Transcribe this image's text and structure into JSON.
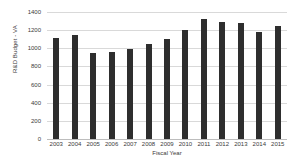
{
  "chart_data": {
    "type": "bar",
    "title": "",
    "xlabel": "Fiscal Year",
    "ylabel": "R&D Budget - VA",
    "categories": [
      "2003",
      "2004",
      "2005",
      "2006",
      "2007",
      "2008",
      "2009",
      "2010",
      "2011",
      "2012",
      "2013",
      "2014",
      "2015"
    ],
    "values": [
      1110,
      1150,
      950,
      955,
      990,
      1050,
      1105,
      1200,
      1325,
      1295,
      1275,
      1180,
      1250
    ],
    "ylim": [
      0,
      1400
    ],
    "yticks": [
      0,
      200,
      400,
      600,
      800,
      1000,
      1200,
      1400
    ],
    "ytick_labels": [
      "0",
      "200",
      "400",
      "600",
      "800",
      "1000",
      "1200",
      "1400"
    ],
    "grid": true,
    "legend": false,
    "series": [
      {
        "name": "R&D Budget - VA",
        "color": "#2e2e2e",
        "values": [
          1110,
          1150,
          950,
          955,
          990,
          1050,
          1105,
          1200,
          1325,
          1295,
          1275,
          1180,
          1250
        ]
      }
    ],
    "colors": {
      "bar": "#2e2e2e",
      "grid": "#d9d9d9",
      "axis": "#bdbdbd",
      "text": "#3a3a3a",
      "background": "#ffffff"
    }
  }
}
